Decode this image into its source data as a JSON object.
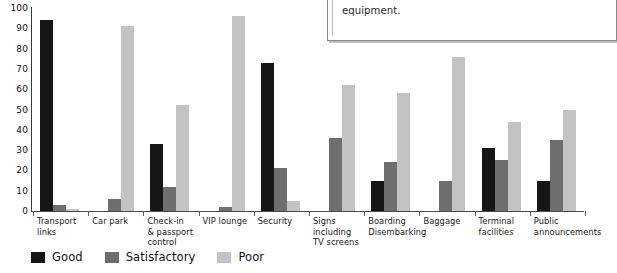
{
  "chart_data": {
    "type": "bar",
    "title": "",
    "xlabel": "",
    "ylabel": "",
    "ylim": [
      0,
      100
    ],
    "grid": false,
    "legend_position": "bottom-left",
    "y_ticks": [
      "100",
      "90",
      "80",
      "70",
      "60",
      "50",
      "40",
      "30",
      "20",
      "10",
      "0"
    ],
    "y_tick_values": [
      100,
      90,
      80,
      70,
      60,
      50,
      40,
      30,
      20,
      10,
      0
    ],
    "categories": [
      "Transport\nlinks",
      "Car park",
      "Check-in\n& passport\ncontrol",
      "VIP lounge",
      "Security",
      "Signs\nincluding\nTV screens",
      "Boarding\nDisembarking",
      "Baggage",
      "Terminal\nfacilities",
      "Public\nannouncements"
    ],
    "series": [
      {
        "name": "Good",
        "color": "#161616",
        "values": [
          94,
          0,
          33,
          0,
          73,
          0,
          15,
          0,
          31,
          15
        ]
      },
      {
        "name": "Satisfactory",
        "color": "#6e6e6e",
        "values": [
          3,
          6,
          12,
          2,
          21,
          36,
          24,
          15,
          25,
          35
        ]
      },
      {
        "name": "Poor",
        "color": "#c3c3c3",
        "values": [
          1,
          91,
          52,
          96,
          5,
          62,
          58,
          76,
          44,
          50
        ]
      }
    ]
  },
  "legend": {
    "items": [
      {
        "label": "Good",
        "color": "#161616"
      },
      {
        "label": "Satisfactory",
        "color": "#6e6e6e"
      },
      {
        "label": "Poor",
        "color": "#c3c3c3"
      }
    ]
  },
  "note_box": {
    "text": "improving communications than investing in expen\nequipment."
  }
}
